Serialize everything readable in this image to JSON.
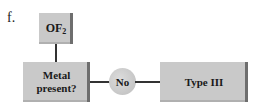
{
  "figure_label": "f.",
  "nodes": {
    "start": {
      "text": "OF",
      "subscript": "2"
    },
    "decision": {
      "line1": "Metal",
      "line2": "present?"
    },
    "answer": {
      "text": "No"
    },
    "result": {
      "text": "Type III"
    }
  },
  "colors": {
    "box_fill": "#c9c9c9",
    "box_edge": "#6e6e6e",
    "line": "#333333"
  }
}
